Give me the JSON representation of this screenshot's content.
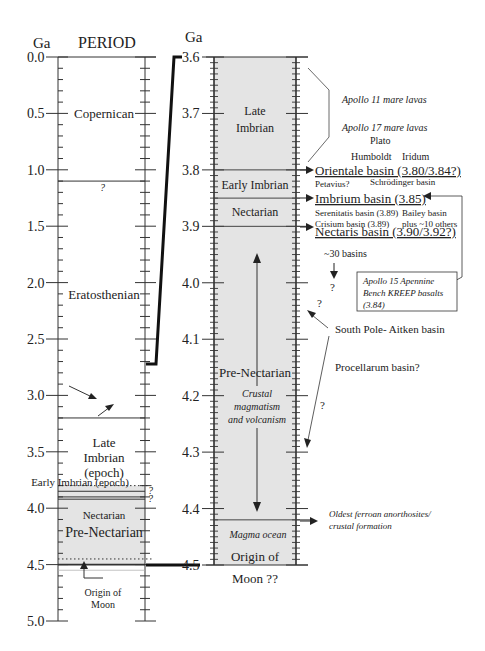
{
  "left_column": {
    "unit_label": "Ga",
    "header": "PERIOD",
    "axis": {
      "min": 0.0,
      "max": 5.0,
      "labels": [
        "0.0",
        "0.5",
        "1.0",
        "1.5",
        "2.0",
        "2.5",
        "3.0",
        "3.5",
        "4.0",
        "4.5",
        "5.0"
      ],
      "minor_step": 0.1
    },
    "boundaries": [
      {
        "age": 1.1,
        "style": "solid",
        "note": "?"
      },
      {
        "age": 3.2,
        "style": "solid"
      },
      {
        "age": 3.8,
        "style": "dotted"
      },
      {
        "age": 3.85,
        "style": "solid",
        "note": "?"
      },
      {
        "age": 3.9,
        "style": "solid"
      },
      {
        "age": 3.92,
        "style": "solid",
        "note": "?"
      },
      {
        "age": 4.45,
        "style": "dotted"
      },
      {
        "age": 4.5,
        "style": "solid-bold"
      },
      {
        "age": 4.55,
        "style": "faint"
      }
    ],
    "periods": [
      {
        "label": "Copernican",
        "age": 0.5
      },
      {
        "label": "Eratosthenian",
        "age": 2.1
      },
      {
        "label": "Late",
        "age": 3.41
      },
      {
        "label": "Imbrian",
        "age": 3.55
      },
      {
        "label": "(epoch)",
        "age": 3.68
      },
      {
        "label": "Early Imbrian (epoch)",
        "age": 3.76
      },
      {
        "label": "Nectarian",
        "age": 4.05
      },
      {
        "label": "Pre-Nectarian",
        "age": 4.21
      }
    ],
    "origin_note": [
      "Origin of",
      "Moon"
    ],
    "shaded_range": [
      3.8,
      4.5
    ]
  },
  "right_column": {
    "unit_label": "Ga",
    "axis": {
      "min": 3.6,
      "max": 4.5,
      "labels": [
        "3.6",
        "3.7",
        "3.8",
        "3.9",
        "4.0",
        "4.1",
        "4.2",
        "4.3",
        "4.4",
        "4.5"
      ],
      "minor_step": 0.01
    },
    "periods": [
      {
        "label": "Late",
        "age": 3.695
      },
      {
        "label": "Imbrian",
        "age": 3.725
      },
      {
        "label": "Early Imbrian",
        "age": 3.827
      },
      {
        "label": "Nectarian",
        "age": 3.875
      },
      {
        "label": "Pre-Nectarian",
        "age": 4.16
      },
      {
        "label": "Origin of",
        "age": 4.485
      },
      {
        "label": "Moon ??",
        "age": 4.525
      }
    ],
    "boundaries": [
      3.8,
      3.85,
      3.9,
      4.42
    ],
    "process_notes": [
      "Crustal",
      "magmatism",
      "and volcanism"
    ],
    "magma_ocean": "Magma ocean"
  },
  "annotations": {
    "mare_lavas": [
      "Apollo 11 mare lavas",
      "Apollo 17 mare lavas"
    ],
    "craters_top": [
      "Plato",
      "Humboldt",
      "Iridum"
    ],
    "orientale": "Orientale basin (3.80/3.84?)",
    "petavius": "Petavius?",
    "schrodinger": "Schrödinger basin",
    "imbrium": "Imbrium basin (3.85)",
    "serenitatis": "Serenitatis basin (3.89)",
    "bailey": "Bailey basin",
    "crisium": "Crisium basin (3.89)",
    "plus_others": "plus ~10 others",
    "nectaris": "Nectaris basin (3.90/3.92?)",
    "thirty_basins": "~30 basins",
    "question": "?",
    "apollo15_box": [
      "Apollo 15 Apennine",
      "Bench KREEP basalts",
      "(3.84)"
    ],
    "south_pole": "South Pole- Aitken basin",
    "procellarum": "Procellarum basin?",
    "ferroan": [
      "Oldest ferroan anorthosites/",
      "crustal formation"
    ]
  },
  "colors": {
    "shade": "#e4e4e4",
    "ink": "#222222",
    "line": "#333333"
  }
}
